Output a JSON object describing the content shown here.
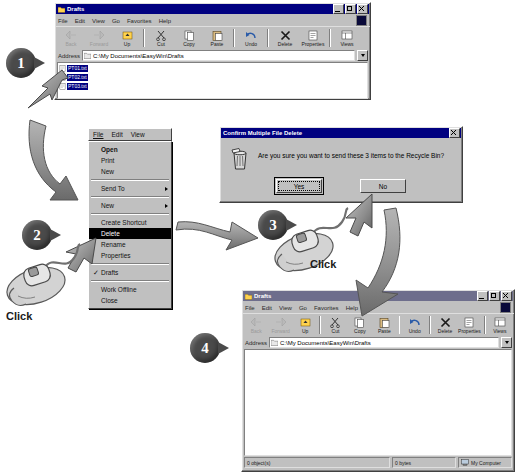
{
  "explorer_top": {
    "title": "Drafts",
    "menu": [
      "File",
      "Edit",
      "View",
      "Go",
      "Favorites",
      "Help"
    ],
    "toolbar": [
      {
        "label": "Back",
        "icon": "back-arrow-icon",
        "disabled": true
      },
      {
        "label": "Forward",
        "icon": "forward-arrow-icon",
        "disabled": true
      },
      {
        "label": "Up",
        "icon": "up-folder-icon",
        "disabled": false
      },
      {
        "label": "Cut",
        "icon": "scissors-icon",
        "disabled": false
      },
      {
        "label": "Copy",
        "icon": "copy-pages-icon",
        "disabled": false
      },
      {
        "label": "Paste",
        "icon": "clipboard-icon",
        "disabled": false
      },
      {
        "label": "Undo",
        "icon": "undo-arrow-icon",
        "disabled": false
      },
      {
        "label": "Delete",
        "icon": "delete-x-icon",
        "disabled": false
      },
      {
        "label": "Properties",
        "icon": "properties-icon",
        "disabled": false
      },
      {
        "label": "Views",
        "icon": "views-icon",
        "disabled": false
      }
    ],
    "address_label": "Address",
    "address_value": "C:\\My Documents\\EasyWin\\Drafts",
    "files": [
      {
        "name": "PT01.txt",
        "selected": true
      },
      {
        "name": "PT02.txt",
        "selected": true
      },
      {
        "name": "PT03.txt",
        "selected": true
      }
    ]
  },
  "context_menu": {
    "menubar": [
      "File",
      "Edit",
      "View"
    ],
    "items": [
      {
        "label": "Open",
        "bold": true,
        "type": "item"
      },
      {
        "label": "Print",
        "type": "item"
      },
      {
        "label": "New",
        "type": "item"
      },
      {
        "type": "separator"
      },
      {
        "label": "Send To",
        "type": "submenu"
      },
      {
        "type": "separator"
      },
      {
        "label": "New",
        "type": "submenu"
      },
      {
        "type": "separator"
      },
      {
        "label": "Create Shortcut",
        "type": "item"
      },
      {
        "label": "Delete",
        "type": "item",
        "selected": true
      },
      {
        "label": "Rename",
        "type": "item"
      },
      {
        "label": "Properties",
        "type": "item"
      },
      {
        "type": "separator"
      },
      {
        "label": "Drafts",
        "type": "checked"
      },
      {
        "type": "separator"
      },
      {
        "label": "Work Offline",
        "type": "item"
      },
      {
        "label": "Close",
        "type": "item"
      }
    ]
  },
  "dialog": {
    "title": "Confirm Multiple File Delete",
    "message": "Are you sure you want to send these 3 items to the Recycle Bin?",
    "icon": "recycle-bin-icon",
    "buttons": [
      {
        "label": "Yes",
        "default": true
      },
      {
        "label": "No",
        "default": false
      }
    ]
  },
  "explorer_bottom": {
    "title": "Drafts",
    "menu": [
      "File",
      "Edit",
      "View",
      "Go",
      "Favorites",
      "Help"
    ],
    "toolbar": [
      {
        "label": "Back",
        "icon": "back-arrow-icon",
        "disabled": true
      },
      {
        "label": "Forward",
        "icon": "forward-arrow-icon",
        "disabled": true
      },
      {
        "label": "Up",
        "icon": "up-folder-icon",
        "disabled": false
      },
      {
        "label": "Cut",
        "icon": "scissors-icon",
        "disabled": false
      },
      {
        "label": "Copy",
        "icon": "copy-pages-icon",
        "disabled": false
      },
      {
        "label": "Paste",
        "icon": "clipboard-icon",
        "disabled": false
      },
      {
        "label": "Undo",
        "icon": "undo-arrow-icon",
        "disabled": false
      },
      {
        "label": "Delete",
        "icon": "delete-x-icon",
        "disabled": false
      },
      {
        "label": "Properties",
        "icon": "properties-icon",
        "disabled": false
      },
      {
        "label": "Views",
        "icon": "views-icon",
        "disabled": false
      }
    ],
    "address_label": "Address",
    "address_value": "C:\\My Documents\\EasyWin\\Drafts",
    "files": [],
    "status": {
      "objects": "0 object(s)",
      "size": "0 bytes",
      "zone": "My Computer"
    }
  },
  "callouts": {
    "step1": "1",
    "step2": "2",
    "step3": "3",
    "step4": "4",
    "click_left": "Click",
    "click_right": "Click"
  },
  "colors": {
    "titlebar_active": "#000080",
    "titlebar_inactive": "#6e6e8c",
    "face": "#c0c0c0",
    "selection": "#000080",
    "menu_highlight": "#000000",
    "callout": "#4a4a4a"
  }
}
